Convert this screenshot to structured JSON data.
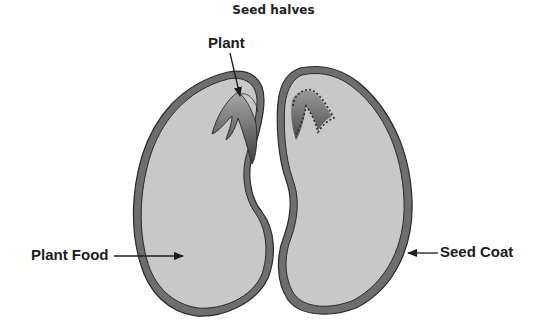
{
  "title": "Seed halves",
  "labels": {
    "plant": "Plant",
    "plant_food": "Plant Food",
    "seed_coat": "Seed Coat"
  },
  "colors": {
    "seed_coat": "#6e6e6e",
    "plant_food": "#c8c8c8",
    "outline": "#2a2a2a",
    "embryo_dark": "#4a4a4a",
    "embryo_light": "#9a9a9a",
    "text": "#1c1c1c"
  }
}
